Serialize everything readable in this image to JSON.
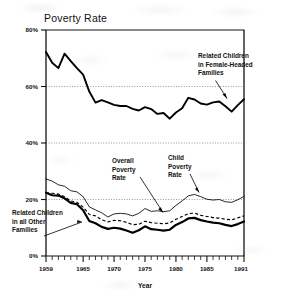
{
  "chart_data": {
    "type": "line",
    "title": "Poverty Rate",
    "xlabel": "Year",
    "ylabel": "",
    "xlim": [
      1959,
      1991
    ],
    "ylim": [
      0,
      80
    ],
    "grid": true,
    "grid_levels": [
      20,
      40,
      60
    ],
    "legend_position": "inline-annotations",
    "x": [
      1959,
      1960,
      1961,
      1962,
      1963,
      1964,
      1965,
      1966,
      1967,
      1968,
      1969,
      1970,
      1971,
      1972,
      1973,
      1974,
      1975,
      1976,
      1977,
      1978,
      1979,
      1980,
      1981,
      1982,
      1983,
      1984,
      1985,
      1986,
      1987,
      1988,
      1989,
      1990,
      1991
    ],
    "xticks": [
      1959,
      1965,
      1970,
      1975,
      1980,
      1985,
      1991
    ],
    "xtick_labels": [
      "1959",
      "1965",
      "1970",
      "1975",
      "1980",
      "1985",
      "1991"
    ],
    "yticks": [
      0,
      20,
      40,
      60,
      80
    ],
    "ytick_labels": [
      "0%",
      "20%",
      "40%",
      "60%",
      "80%"
    ],
    "series": [
      {
        "name": "Related Children in Female-Headed Families",
        "style": "thick-solid",
        "values": [
          72.2,
          68.4,
          66.5,
          71.6,
          69.0,
          66.5,
          64.2,
          58.2,
          54.3,
          55.2,
          54.4,
          53.5,
          53.1,
          53.1,
          52.1,
          51.5,
          52.7,
          52.0,
          50.3,
          50.6,
          48.6,
          50.8,
          52.3,
          56.0,
          55.4,
          54.0,
          53.6,
          54.4,
          54.7,
          53.0,
          51.1,
          53.4,
          55.5
        ]
      },
      {
        "name": "Child Poverty Rate",
        "style": "thin-solid",
        "values": [
          27.3,
          26.5,
          25.2,
          24.7,
          23.1,
          22.7,
          21.0,
          17.4,
          16.3,
          15.3,
          13.8,
          14.9,
          15.1,
          14.9,
          14.2,
          15.1,
          16.8,
          15.8,
          16.0,
          15.7,
          16.0,
          17.9,
          19.5,
          21.3,
          21.8,
          21.0,
          20.1,
          19.8,
          20.0,
          19.2,
          19.0,
          19.9,
          21.1
        ]
      },
      {
        "name": "Overall Poverty Rate",
        "style": "dashed",
        "values": [
          22.4,
          22.2,
          21.9,
          21.0,
          19.5,
          19.0,
          17.3,
          14.7,
          14.2,
          12.8,
          12.1,
          12.6,
          12.5,
          11.9,
          11.1,
          11.2,
          12.3,
          11.8,
          11.6,
          11.4,
          11.7,
          13.0,
          14.0,
          15.0,
          15.2,
          14.4,
          14.0,
          13.6,
          13.4,
          13.0,
          12.8,
          13.5,
          14.2
        ]
      },
      {
        "name": "Related Children in all Other Families",
        "style": "thickest-solid",
        "values": [
          22.4,
          21.5,
          21.4,
          20.4,
          18.8,
          18.3,
          16.2,
          12.4,
          11.6,
          10.3,
          9.6,
          10.0,
          9.7,
          9.0,
          8.2,
          9.1,
          10.5,
          9.5,
          9.3,
          9.0,
          9.3,
          11.0,
          12.0,
          13.3,
          13.5,
          12.7,
          12.2,
          11.8,
          11.6,
          11.0,
          10.6,
          11.3,
          12.2
        ]
      }
    ],
    "annotations": [
      {
        "name": "related-children-female-headed",
        "label_lines": [
          "Related Children",
          "in Female-Headed",
          "Families"
        ],
        "points_to_year": 1989,
        "points_to_value": 51.1
      },
      {
        "name": "overall-poverty-rate",
        "label_lines": [
          "Overall",
          "Poverty",
          "Rate"
        ],
        "points_to_year": 1978,
        "points_to_value": 11.4
      },
      {
        "name": "child-poverty-rate",
        "label_lines": [
          "Child",
          "Poverty",
          "Rate"
        ],
        "points_to_year": 1983,
        "points_to_value": 21.8
      },
      {
        "name": "related-children-all-other",
        "label_lines": [
          "Related Children",
          "in all Other",
          "Families"
        ],
        "points_to_year": 1968,
        "points_to_value": 10.3
      }
    ]
  },
  "axis": {
    "x_axis_title": "Year",
    "ytick_0": "0%",
    "ytick_20": "20%",
    "ytick_40": "40%",
    "ytick_60": "60%",
    "ytick_80": "80%",
    "xtick_1959": "1959",
    "xtick_1965": "1965",
    "xtick_1970": "1970",
    "xtick_1975": "1975",
    "xtick_1980": "1980",
    "xtick_1985": "1985",
    "xtick_1991": "1991"
  },
  "annot_text": {
    "female_headed_l1": "Related Children",
    "female_headed_l2": "in Female-Headed",
    "female_headed_l3": "Families",
    "overall_l1": "Overall",
    "overall_l2": "Poverty",
    "overall_l3": "Rate",
    "child_l1": "Child",
    "child_l2": "Poverty",
    "child_l3": "Rate",
    "other_l1": "Related Children",
    "other_l2": "in all Other",
    "other_l3": "Families"
  },
  "title": {
    "text": "Poverty Rate"
  }
}
